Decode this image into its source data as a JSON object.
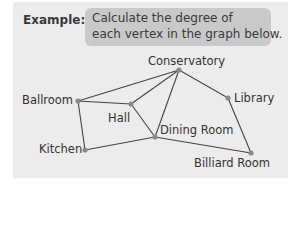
{
  "example": {
    "label": "Example:",
    "line1": "Calculate the degree of",
    "line2": "each vertex in the graph below."
  },
  "graph": {
    "nodes": [
      {
        "id": "conservatory",
        "label": "Conservatory",
        "x": 179,
        "y": 70
      },
      {
        "id": "ballroom",
        "label": "Ballroom",
        "x": 78,
        "y": 101
      },
      {
        "id": "hall",
        "label": "Hall",
        "x": 131,
        "y": 104
      },
      {
        "id": "library",
        "label": "Library",
        "x": 228,
        "y": 98
      },
      {
        "id": "dining",
        "label": "Dining Room",
        "x": 155,
        "y": 137
      },
      {
        "id": "kitchen",
        "label": "Kitchen",
        "x": 85,
        "y": 150
      },
      {
        "id": "billiard",
        "label": "Billiard Room",
        "x": 251,
        "y": 153
      }
    ],
    "edges": [
      [
        "ballroom",
        "conservatory"
      ],
      [
        "ballroom",
        "hall"
      ],
      [
        "ballroom",
        "kitchen"
      ],
      [
        "hall",
        "conservatory"
      ],
      [
        "hall",
        "dining"
      ],
      [
        "conservatory",
        "dining"
      ],
      [
        "conservatory",
        "library"
      ],
      [
        "library",
        "billiard"
      ],
      [
        "dining",
        "billiard"
      ],
      [
        "kitchen",
        "dining"
      ]
    ]
  }
}
